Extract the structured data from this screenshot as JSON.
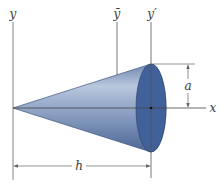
{
  "figure": {
    "labels": {
      "y_axis": "y",
      "y_bar": "ȳ",
      "y_prime": "y′",
      "x_axis": "x",
      "radius": "a",
      "height": "h"
    },
    "colors": {
      "cone_light": "#b8c6dc",
      "cone_mid": "#7f95ba",
      "cone_dark": "#4e6a98",
      "base_face": "#3f5f95",
      "line": "#555555"
    },
    "geometry": {
      "apex": [
        13,
        108
      ],
      "base_center": [
        151,
        108
      ],
      "base_rx": 15,
      "base_ry": 44
    }
  }
}
